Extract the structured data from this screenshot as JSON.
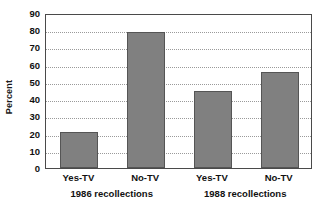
{
  "chart_data": {
    "type": "bar",
    "title": "",
    "subtitle": "",
    "xlabel": "",
    "ylabel": "Percent",
    "categories": [
      "Yes-TV",
      "No-TV",
      "Yes-TV",
      "No-TV"
    ],
    "values": [
      21,
      79,
      45,
      55.5
    ],
    "groups": [
      {
        "label": "1986 recollections",
        "categories": [
          "Yes-TV",
          "No-TV"
        ],
        "values": [
          21,
          79
        ]
      },
      {
        "label": "1988 recollections",
        "categories": [
          "Yes-TV",
          "No-TV"
        ],
        "values": [
          45,
          55.5
        ]
      }
    ],
    "ylim": [
      0,
      90
    ],
    "yticks": [
      0,
      10,
      20,
      30,
      40,
      50,
      60,
      70,
      80,
      90
    ],
    "ytick_labels": [
      "0",
      "10",
      "20",
      "30",
      "40",
      "50",
      "60",
      "70",
      "80",
      "90"
    ],
    "grid": true,
    "grid_axis": "y",
    "grid_style": "dotted",
    "legend": false,
    "legend_position": "none",
    "bar_color": "#808080",
    "bar_edge_color": "#555555",
    "grid_color": "#9a9a9a",
    "frame_color": "#4a4a4a",
    "background_color": "#ffffff",
    "text_color": "#111111"
  }
}
